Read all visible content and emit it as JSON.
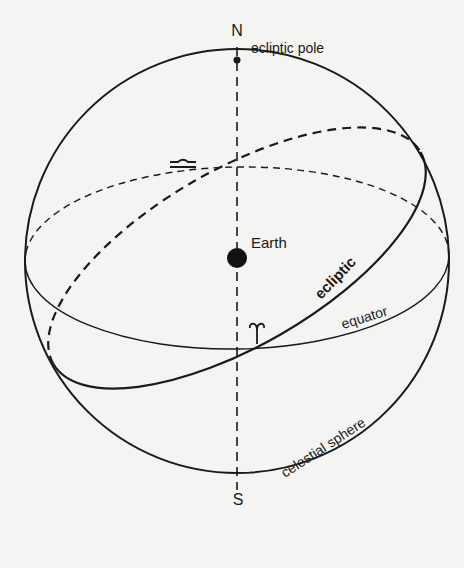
{
  "diagram": {
    "type": "celestial-sphere",
    "colors": {
      "background": "#f4f4f2",
      "ink": "#1a1a1a"
    },
    "labels": {
      "north": "N",
      "south": "S",
      "ecliptic_pole": "ecliptic pole",
      "earth": "Earth",
      "ecliptic": "ecliptic",
      "equator": "equator",
      "celestial_sphere": "celestial sphere",
      "libra_symbol": "♎",
      "aries_symbol": "♈"
    },
    "symbols": {
      "libra_point": "autumnal equinox (Libra)",
      "aries_point": "vernal equinox (Aries)"
    }
  }
}
